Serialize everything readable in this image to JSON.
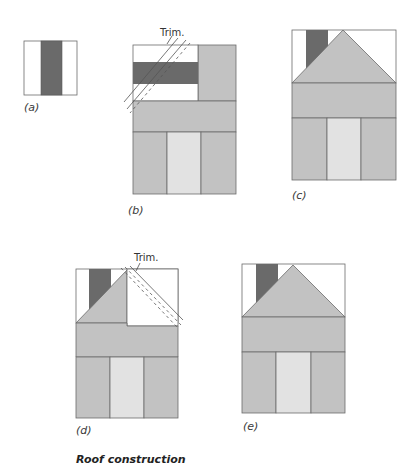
{
  "title": "Roof construction",
  "colors": {
    "outline": "#6b6b6b",
    "dark_fabric": "#6a6a6a",
    "medium_fabric": "#c2c2c2",
    "light_fabric": "#e2e2e2",
    "background_fabric": "#ffffff",
    "trim_line": "#555555"
  },
  "figures": [
    {
      "id": "a",
      "label": "(a)",
      "description": "Chimney strip unit: dark stripe between two white strips"
    },
    {
      "id": "b",
      "label": "(b)",
      "description": "Chimney unit placed on gray block, trim lines drawn diagonally",
      "annotation": "Trim."
    },
    {
      "id": "c",
      "label": "(c)",
      "description": "Completed house block with left roof half and chimney"
    },
    {
      "id": "d",
      "label": "(d)",
      "description": "Right roof corner added as white square with trim lines",
      "annotation": "Trim."
    },
    {
      "id": "e",
      "label": "(e)",
      "description": "Completed house block with full roof"
    }
  ]
}
